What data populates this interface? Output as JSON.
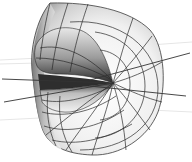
{
  "figure": {
    "background": "#ffffff",
    "colors": {
      "mesh_line": "#2a2a2a",
      "surface_light": "#f4f4f4",
      "surface_mid": "#c8c8c8",
      "surface_dark": "#3a3a3a",
      "axis_line": "#333333"
    },
    "mouth_corner": [
      113,
      83
    ],
    "axis_lines": [
      {
        "from": [
          2,
          79
        ],
        "to": [
          113,
          83
        ]
      },
      {
        "from": [
          4,
          102
        ],
        "to": [
          113,
          83
        ]
      },
      {
        "from": [
          90,
          80
        ],
        "to": [
          190,
          53
        ]
      },
      {
        "from": [
          90,
          86
        ],
        "to": [
          186,
          96
        ]
      }
    ]
  }
}
